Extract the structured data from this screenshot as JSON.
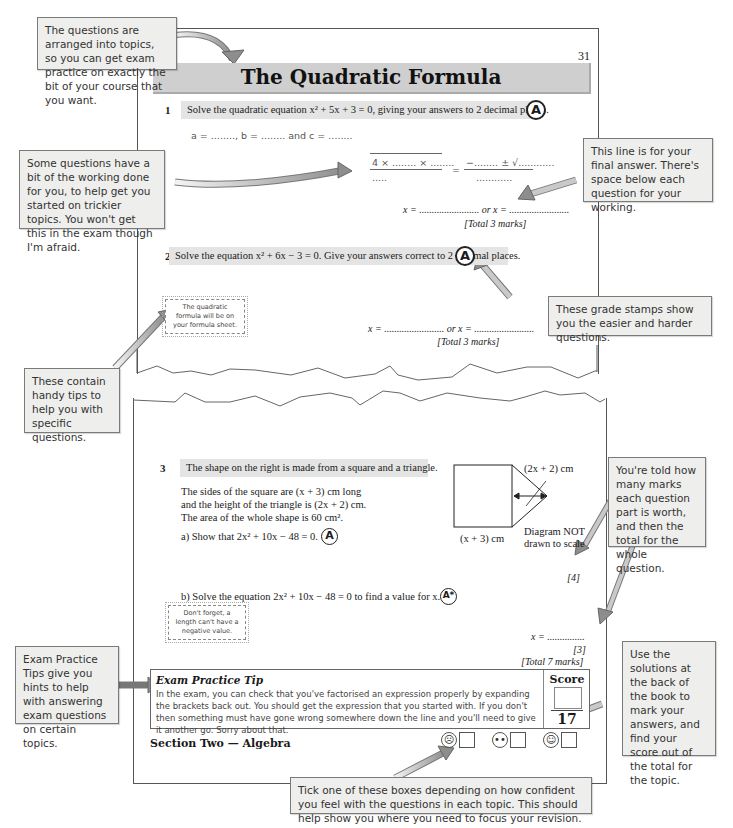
{
  "page": {
    "number": "31",
    "title": "The Quadratic Formula",
    "accent_color": "#cfcfcf",
    "section_footer": "Section Two — Algebra"
  },
  "callouts": {
    "topics": "The questions are arranged into topics, so you can get exam practice on exactly the bit of your course that you want.",
    "working": "Some questions have a bit of the working done for you, to help get you started on trickier topics.  You won't get this in the exam though I'm afraid.",
    "final_answer": "This line is for your final answer.  There's space below each question for your working.",
    "grade_stamps": "These grade stamps show you the easier and harder questions.",
    "tips": "These contain handy tips to help you with specific questions.",
    "marks": "You're told how many marks each question part is worth, and then the total for the whole question.",
    "exam_tips": "Exam Practice Tips give you hints to help with answering exam questions on certain topics.",
    "solutions": "Use the solutions at the back of the book to mark your answers, and find your score out of the total for the topic.",
    "confidence": "Tick one of these boxes depending on how confident you feel with the questions in each topic.  This should help show you where you need to focus your revision."
  },
  "questions": [
    {
      "number": "1",
      "prompt": "Solve the quadratic equation x² + 5x + 3 = 0, giving your answers to 2 decimal places.",
      "grade": "A",
      "coefficients_line": "a = ........,  b = ........  and  c = ........",
      "fraction_left_top": "4 × ........ × ........",
      "fraction_left_bottom": ".....",
      "equals": "=",
      "fraction_right_top": "−........ ± √............",
      "fraction_right_bottom": "............",
      "answer_line": "x = ........................ or x = ........................",
      "marks": "[Total 3 marks]"
    },
    {
      "number": "2",
      "prompt": "Solve the equation x² + 6x − 3 = 0.  Give your answers correct to 2 decimal places.",
      "grade": "A",
      "tip": "The quadratic formula will be on your formula sheet.",
      "answer_line": "x = ........................ or x = ........................",
      "marks": "[Total 3 marks]"
    },
    {
      "number": "3",
      "prompt": "The shape on the right is made from a square and a triangle.",
      "body": [
        "The sides of the square are (x + 3) cm long",
        "and the height of the triangle is (2x + 2) cm.",
        "The area of the whole shape is 60 cm²."
      ],
      "part_a": "a)  Show that 2x² + 10x − 48 = 0.",
      "part_a_grade": "A",
      "part_a_marks": "[4]",
      "part_b": "b)  Solve the equation 2x² + 10x − 48 = 0 to find a value for x.",
      "part_b_grade": "A*",
      "tip": "Don't forget, a length can't have a negative value.",
      "answer_line": "x = ...............",
      "part_b_marks": "[3]",
      "marks": "[Total 7 marks]",
      "diagram": {
        "triangle_label": "(2x + 2) cm",
        "square_label": "(x + 3) cm",
        "note_line1": "Diagram NOT",
        "note_line2": "drawn to scale"
      }
    }
  ],
  "exam_tip": {
    "title": "Exam Practice Tip",
    "body": "In the exam, you can check that you've factorised an expression properly by expanding the brackets back out. You should get the expression that you started with.  If you don't then something must have gone wrong somewhere down the line and you'll need to give it another go.  Sorry about that."
  },
  "score": {
    "label": "Score",
    "total": "17"
  },
  "confidence_faces": [
    {
      "icon": "sad-face-icon",
      "glyph": "☹"
    },
    {
      "icon": "neutral-face-icon",
      "glyph": "😐"
    },
    {
      "icon": "happy-face-icon",
      "glyph": "☺"
    }
  ]
}
